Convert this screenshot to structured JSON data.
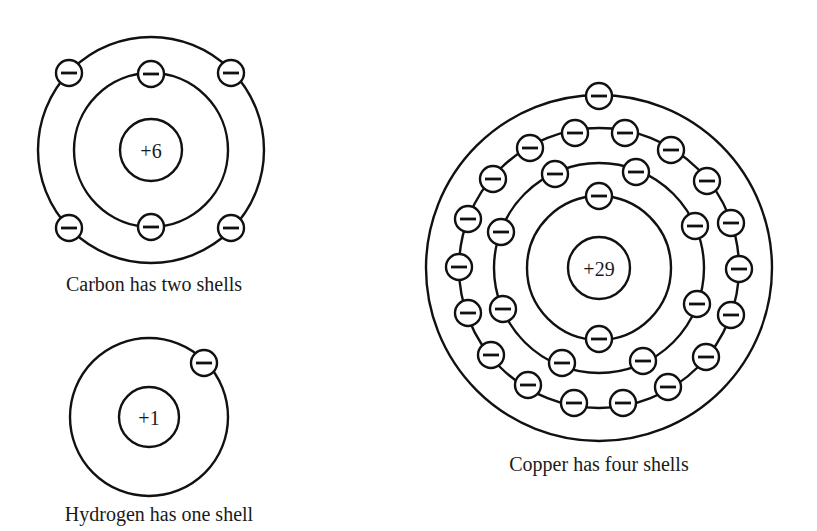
{
  "diagram": {
    "colors": {
      "stroke": "#111111",
      "background": "#ffffff",
      "text": "#1a1a1a"
    },
    "atoms": [
      {
        "name": "Carbon",
        "nucleus_label": "+6",
        "caption": "Carbon has two shells",
        "center": [
          151,
          150
        ],
        "nucleus_radius": 31,
        "caption_pos": [
          154,
          291
        ],
        "shells": [
          {
            "radius": 77,
            "electrons": [
              [
                151,
                74
              ],
              [
                151,
                227
              ]
            ]
          },
          {
            "radius": 113,
            "electrons": [
              [
                69,
                73
              ],
              [
                231,
                73
              ],
              [
                69,
                228
              ],
              [
                231,
                228
              ]
            ]
          }
        ]
      },
      {
        "name": "Hydrogen",
        "nucleus_label": "+1",
        "caption": "Hydrogen has one shell",
        "center": [
          149,
          417
        ],
        "nucleus_radius": 30,
        "caption_pos": [
          159,
          521
        ],
        "shells": [
          {
            "radius": 79,
            "electrons": [
              [
                204,
                363
              ]
            ]
          }
        ]
      },
      {
        "name": "Copper",
        "nucleus_label": "+29",
        "caption": "Copper has four shells",
        "center": [
          599,
          268
        ],
        "nucleus_radius": 31,
        "caption_pos": [
          599,
          471
        ],
        "shells": [
          {
            "radius": 72,
            "electrons": [
              [
                599,
                196
              ],
              [
                599,
                339
              ]
            ]
          },
          {
            "radius": 105,
            "electrons": [
              [
                555,
                174
              ],
              [
                636,
                172
              ],
              [
                501,
                232
              ],
              [
                695,
                226
              ],
              [
                503,
                309
              ],
              [
                697,
                304
              ],
              [
                562,
                363
              ],
              [
                643,
                361
              ]
            ]
          },
          {
            "radius": 140,
            "electrons": [
              [
                575,
                133
              ],
              [
                625,
                133
              ],
              [
                530,
                148
              ],
              [
                671,
                150
              ],
              [
                493,
                179
              ],
              [
                707,
                181
              ],
              [
                468,
                219
              ],
              [
                731,
                223
              ],
              [
                459,
                267
              ],
              [
                739,
                269
              ],
              [
                468,
                313
              ],
              [
                731,
                315
              ],
              [
                491,
                355
              ],
              [
                706,
                357
              ],
              [
                528,
                385
              ],
              [
                668,
                387
              ],
              [
                574,
                403
              ],
              [
                623,
                403
              ]
            ]
          },
          {
            "radius": 173,
            "electrons": [
              [
                599,
                96
              ]
            ]
          }
        ]
      }
    ],
    "electron_symbol": "minus-sign",
    "electron_radius": 13
  }
}
